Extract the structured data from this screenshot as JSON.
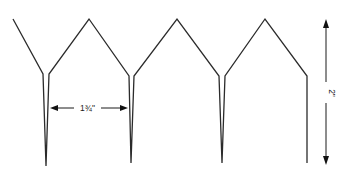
{
  "diagram": {
    "type": "technical-template",
    "stroke_color": "#2b2b2b",
    "dimensions": {
      "horizontal": {
        "label": "1¾\"",
        "meaning": "spacing between stakes"
      },
      "vertical": {
        "label": "2\"",
        "meaning": "overall height"
      }
    }
  }
}
